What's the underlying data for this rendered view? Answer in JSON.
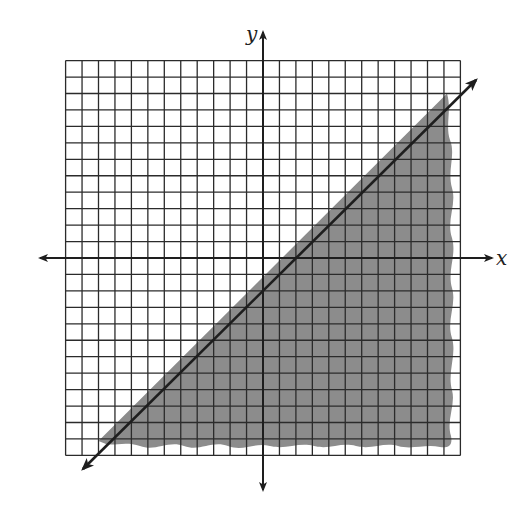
{
  "chart_data": {
    "type": "inequality-graph",
    "title": "",
    "xlabel": "x",
    "ylabel": "y",
    "xlim": [
      -12,
      12
    ],
    "ylim": [
      -12,
      12
    ],
    "grid": true,
    "grid_step": 1,
    "tick_labels": false,
    "boundary_line": {
      "equation": "y = x - 2",
      "slope": 1,
      "y_intercept": -2,
      "x_intercept": 2,
      "style": "solid",
      "arrows": "both ends"
    },
    "shaded_region": {
      "description": "below the line (region to the lower right)",
      "inequality": "y ≤ x − 2",
      "color": "#8a8a8a"
    },
    "legend": null
  },
  "labels": {
    "x_axis": "x",
    "y_axis": "y"
  },
  "colors": {
    "grid": "#2b2b2b",
    "shade": "#8c8c8c",
    "line": "#1e1e1e",
    "background": "#ffffff"
  }
}
